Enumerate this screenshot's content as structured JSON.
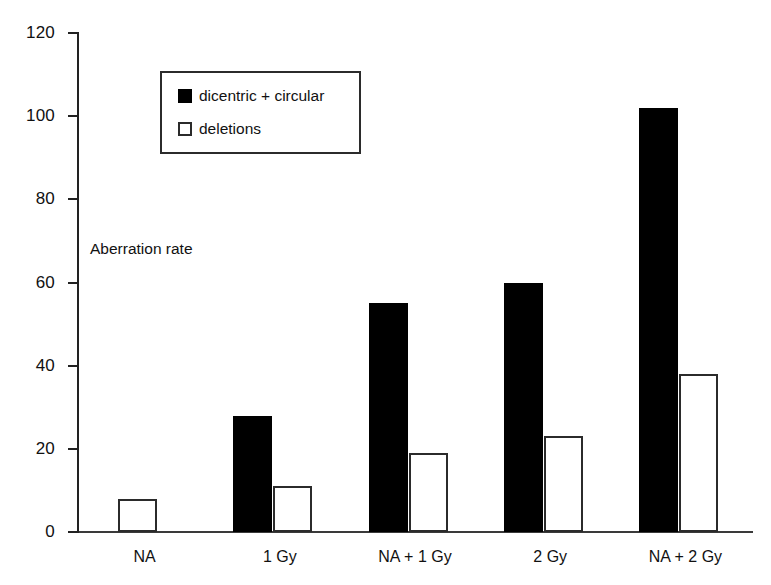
{
  "chart_data": {
    "type": "bar",
    "title": "",
    "subtitle": "",
    "xlabel": "",
    "ylabel": "Aberration rate",
    "ylim": [
      0,
      120
    ],
    "ytick_interval": 20,
    "yticks": [
      120,
      100,
      80,
      60,
      40,
      20,
      0
    ],
    "ytick_labels": [
      "120",
      "100",
      "80",
      "60",
      "40",
      "20",
      "0"
    ],
    "grid": false,
    "legend_position": "upper-left-inside",
    "categories": [
      "NA",
      "1 Gy",
      "NA + 1 Gy",
      "2 Gy",
      "NA + 2 Gy"
    ],
    "series": [
      {
        "name": "dicentric + circular",
        "color": "#000000",
        "style": "filled",
        "values": [
          null,
          28,
          55,
          60,
          102
        ]
      },
      {
        "name": "deletions",
        "color": "#ffffff",
        "style": "hollow",
        "values": [
          8,
          11,
          19,
          23,
          38
        ]
      }
    ]
  },
  "axis": {
    "y_title": "Aberration rate"
  },
  "legend": {
    "entries": [
      {
        "label": "dicentric + circular",
        "swatch": "filled-square-icon"
      },
      {
        "label": "deletions",
        "swatch": "hollow-square-icon"
      }
    ]
  }
}
